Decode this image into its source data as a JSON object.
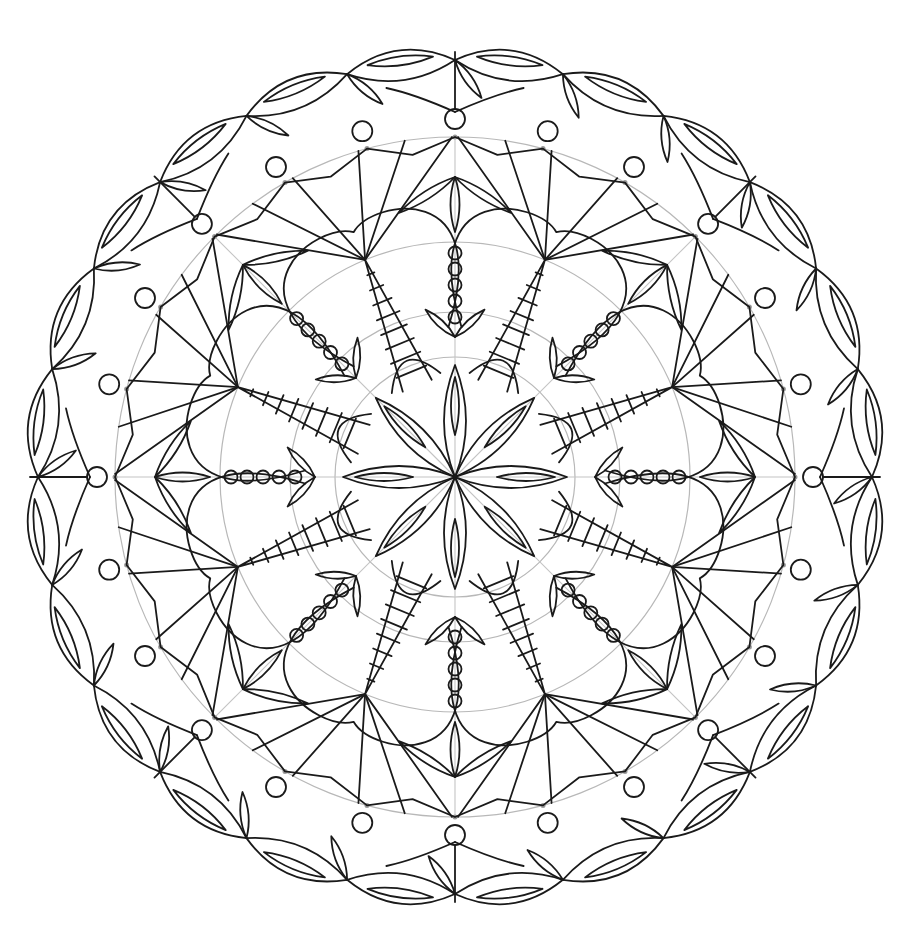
{
  "image": {
    "subject": "mandala coloring page line art",
    "background": "#ffffff",
    "ink_color": "#1a1a1a",
    "guide_color": "#b8b8b8"
  },
  "mandala": {
    "center": [
      455,
      477
    ],
    "symmetry": 8,
    "outer_radius": 425,
    "scallop_count": 24,
    "guide_circle_radii": [
      120,
      165,
      235,
      340
    ],
    "inner_petal_count": 8,
    "bead_chain_count": 5,
    "striped_spikes": 8,
    "outer_bud_circles": 24
  }
}
